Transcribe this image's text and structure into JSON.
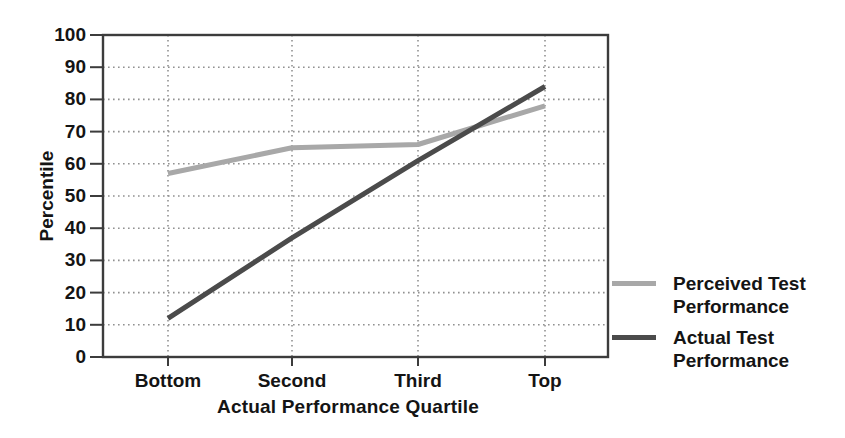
{
  "chart_data": {
    "type": "line",
    "categories": [
      "Bottom",
      "Second",
      "Third",
      "Top"
    ],
    "series": [
      {
        "name": "Perceived Test Performance",
        "values": [
          57,
          65,
          66,
          78
        ],
        "color": "#a8a8a8"
      },
      {
        "name": "Actual Test Performance",
        "values": [
          12,
          37,
          61,
          84
        ],
        "color": "#4b4b4b"
      }
    ],
    "x_axis_label": "Actual Performance Quartile",
    "y_axis_label": "Percentile",
    "ylim": [
      0,
      100
    ],
    "yticks": [
      0,
      10,
      20,
      30,
      40,
      50,
      60,
      70,
      80,
      90,
      100
    ],
    "grid": "dotted",
    "legend_position": "right",
    "axis_color": "#3c3c3c",
    "grid_color": "#919191",
    "text_color": "#141414"
  }
}
